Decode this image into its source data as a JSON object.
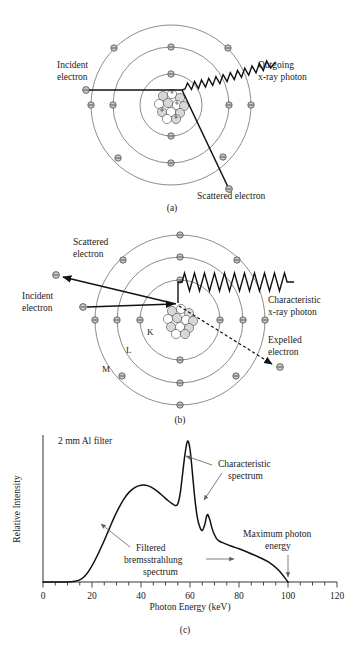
{
  "figure": {
    "panels": [
      {
        "id": "a",
        "label": "(a)",
        "caption_process": "bremsstrahlung",
        "annotations": {
          "incident": "Incident\nelectron",
          "incident_line1": "Incident",
          "incident_line2": "electron",
          "outgoing_line1": "Outgoing",
          "outgoing_line2": "x-ray photon",
          "scattered": "Scattered electron"
        }
      },
      {
        "id": "b",
        "label": "(b)",
        "caption_process": "characteristic",
        "annotations": {
          "scattered_line1": "Scattered",
          "scattered_line2": "electron",
          "incident_line1": "Incident",
          "incident_line2": "electron",
          "characteristic_line1": "Characteristic",
          "characteristic_line2": "x-ray photon",
          "expelled_line1": "Expelled",
          "expelled_line2": "electron",
          "shell_k": "K",
          "shell_l": "L",
          "shell_m": "M"
        }
      },
      {
        "id": "c",
        "label": "(c)"
      }
    ]
  },
  "chart_data": {
    "type": "line",
    "title": "",
    "xlabel": "Photon Energy (keV)",
    "ylabel": "Relative Intensity",
    "xlim": [
      0,
      120
    ],
    "ylim": [
      0,
      1.0
    ],
    "xticks": [
      0,
      20,
      40,
      60,
      80,
      100,
      120
    ],
    "xtick_labels": [
      "0",
      "20",
      "40",
      "60",
      "80",
      "100",
      "120"
    ],
    "minor_tick_step": 5,
    "yticks": [],
    "grid": false,
    "legend": false,
    "series": [
      {
        "name": "Filtered bremsstrahlung spectrum with characteristic peaks",
        "x": [
          0,
          5,
          10,
          13,
          15,
          17,
          19,
          21,
          23,
          25,
          27,
          29,
          31,
          33,
          35,
          37,
          39,
          41,
          43,
          45,
          47,
          49,
          51,
          53,
          54,
          55,
          56,
          57,
          58,
          59,
          60,
          61,
          62,
          63,
          64,
          65,
          66,
          67,
          68,
          69,
          70,
          71,
          72,
          74,
          77,
          80,
          84,
          88,
          92,
          96,
          100
        ],
        "y": [
          0,
          0,
          0,
          0.005,
          0.015,
          0.04,
          0.085,
          0.145,
          0.215,
          0.29,
          0.37,
          0.45,
          0.52,
          0.58,
          0.625,
          0.655,
          0.672,
          0.678,
          0.672,
          0.655,
          0.63,
          0.6,
          0.57,
          0.545,
          0.535,
          0.545,
          0.62,
          0.76,
          0.9,
          0.985,
          0.93,
          0.76,
          0.58,
          0.45,
          0.385,
          0.36,
          0.4,
          0.47,
          0.44,
          0.375,
          0.33,
          0.3,
          0.285,
          0.27,
          0.25,
          0.232,
          0.205,
          0.175,
          0.14,
          0.085,
          0.0
        ]
      }
    ],
    "annotations": [
      {
        "name": "filter-note",
        "text": "2 mm Al filter",
        "x": 18,
        "y": 0.95
      },
      {
        "name": "characteristic-spectrum",
        "text_line1": "Characteristic",
        "text_line2": "spectrum",
        "points_to": [
          59,
          67
        ]
      },
      {
        "name": "filtered-bremsstrahlung",
        "text_line1": "Filtered",
        "text_line2": "bremsstrahlung",
        "text_line3": "spectrum",
        "points_to": [
          30,
          75
        ]
      },
      {
        "name": "maximum-photon-energy",
        "text_line1": "Maximum photon",
        "text_line2": "energy",
        "points_to": [
          100
        ]
      }
    ]
  }
}
